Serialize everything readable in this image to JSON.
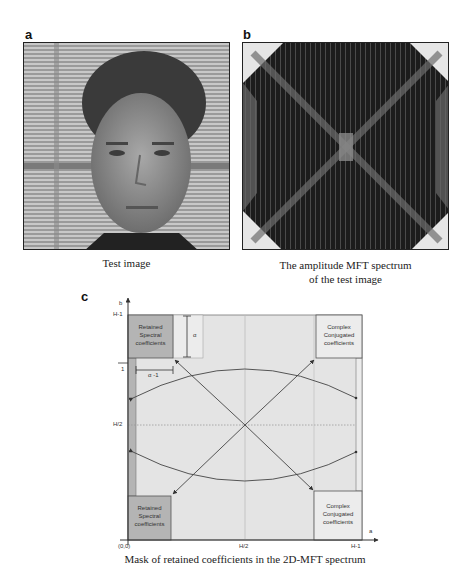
{
  "panels": {
    "a": {
      "label": "a",
      "caption": "Test image"
    },
    "b": {
      "label": "b",
      "caption_line1": "The amplitude MFT spectrum",
      "caption_line2": "of the test image"
    },
    "c": {
      "label": "c",
      "caption": "Mask of retained coefficients in the 2D-MFT spectrum",
      "axes": {
        "y_axis_label": "b",
        "x_axis_label": "a",
        "y_ticks": [
          "H-1",
          "H/2",
          "1"
        ],
        "x_ticks": [
          "(0,0)",
          "H/2",
          "H-1"
        ]
      },
      "boxes": {
        "top_left": [
          "Retained",
          "Spectral",
          "coefficients"
        ],
        "bottom_left": [
          "Retained",
          "Spectral",
          "coefficients"
        ],
        "top_right": [
          "Complex",
          "Conjugated",
          "coefficients"
        ],
        "bottom_right": [
          "Complex",
          "Conjugated",
          "coefficients"
        ]
      },
      "dimensions": {
        "alpha": "α",
        "alpha_minus_1": "α -1"
      },
      "colors": {
        "retained_fill": "#b4b4b4",
        "conjugated_fill": "#ececec",
        "field_fill": "#e4e4e4",
        "stroke": "#555555"
      }
    }
  }
}
